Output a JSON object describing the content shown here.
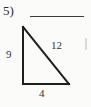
{
  "problem": {
    "number_label": "5)",
    "answer_blank_present": true
  },
  "figure": {
    "shape_name": "right-triangle",
    "labels": {
      "vertical_leg": "9",
      "hypotenuse": "12",
      "horizontal_leg": "4"
    },
    "colors": {
      "ink": "#2b2b2b",
      "line": "#1f1f1f",
      "background": "#fbfbfa"
    },
    "geometry": {
      "top_vertex": [
        23,
        27
      ],
      "bottom_left_vertex": [
        23,
        84
      ],
      "bottom_right_vertex": [
        69,
        84
      ]
    }
  }
}
